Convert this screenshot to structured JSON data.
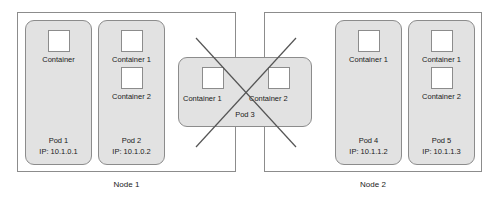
{
  "diagram": {
    "colors": {
      "pod_fill": "#e2e2e2",
      "stroke": "#8c8c8c",
      "cross_stroke": "#555555",
      "text": "#1a1a1a",
      "background": "#ffffff"
    },
    "nodes": [
      {
        "id": "node-1",
        "label": "Node 1",
        "pods": [
          {
            "id": "pod-1",
            "name": "Pod 1",
            "ip": "IP: 10.1.0.1",
            "containers": [
              "Container"
            ]
          },
          {
            "id": "pod-2",
            "name": "Pod 2",
            "ip": "IP: 10.1.0.2",
            "containers": [
              "Container 1",
              "Container 2"
            ]
          }
        ]
      },
      {
        "id": "node-2",
        "label": "Node 2",
        "pods": [
          {
            "id": "pod-4",
            "name": "Pod 4",
            "ip": "IP: 10.1.1.2",
            "containers": [
              "Container 1"
            ]
          },
          {
            "id": "pod-5",
            "name": "Pod 5",
            "ip": "IP: 10.1.1.3",
            "containers": [
              "Container 1",
              "Container 2"
            ]
          }
        ]
      }
    ],
    "straddling_pod": {
      "id": "pod-3",
      "name": "Pod 3",
      "containers": [
        "Container 1",
        "Container 2"
      ],
      "crossed_out": true,
      "cross_icon": "x-cross-icon"
    }
  }
}
